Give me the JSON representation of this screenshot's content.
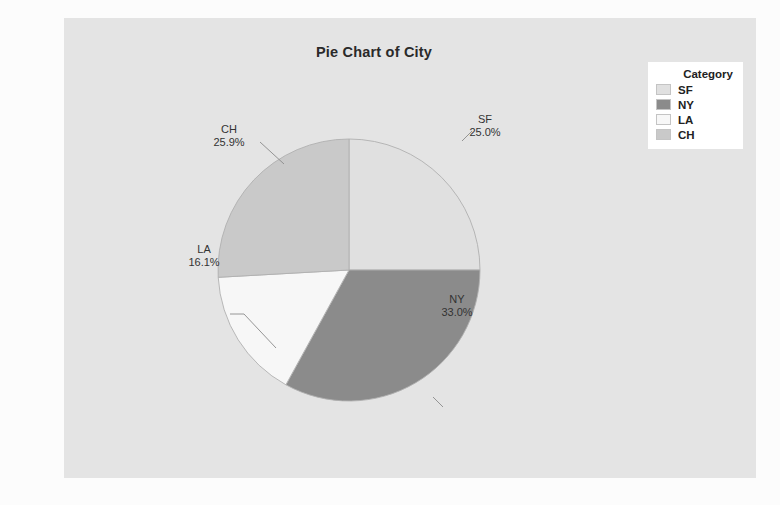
{
  "chart_data": {
    "type": "pie",
    "title": "Pie Chart of City",
    "categories": [
      "SF",
      "NY",
      "LA",
      "CH"
    ],
    "values": [
      25.0,
      33.0,
      16.1,
      25.9
    ],
    "labels": [
      "25.0%",
      "33.0%",
      "16.1%",
      "25.9%"
    ],
    "unit": "%",
    "start_angle_deg": 0,
    "direction": "clockwise",
    "legend_position": "top-right",
    "grid": false,
    "xlabel": "",
    "ylabel": "",
    "slices": [
      {
        "name": "SF",
        "value": 25.0,
        "label": "25.0%",
        "color": "#e0e0e0",
        "start_deg": 0.0,
        "end_deg": 90.0
      },
      {
        "name": "NY",
        "value": 33.0,
        "label": "33.0%",
        "color": "#8b8b8b",
        "start_deg": 90.0,
        "end_deg": 208.8
      },
      {
        "name": "LA",
        "value": 16.1,
        "label": "16.1%",
        "color": "#f7f7f7",
        "start_deg": 208.8,
        "end_deg": 266.8
      },
      {
        "name": "CH",
        "value": 25.9,
        "label": "25.9%",
        "color": "#c9c9c9",
        "start_deg": 266.8,
        "end_deg": 360.0
      }
    ]
  },
  "chart": {
    "title": "Pie Chart of City",
    "background_color": "#e4e4e4",
    "slice_colors": {
      "SF": "#e0e0e0",
      "NY": "#8b8b8b",
      "LA": "#f7f7f7",
      "CH": "#c9c9c9"
    },
    "slice_edge_color": "#b0b0b0",
    "labels": {
      "sf": {
        "name": "SF",
        "percent": "25.0%"
      },
      "ny": {
        "name": "NY",
        "percent": "33.0%"
      },
      "la": {
        "name": "LA",
        "percent": "16.1%"
      },
      "ch": {
        "name": "CH",
        "percent": "25.9%"
      }
    }
  },
  "legend": {
    "title": "Category",
    "background_color": "#ffffff",
    "items": [
      {
        "label": "SF",
        "color": "#e0e0e0"
      },
      {
        "label": "NY",
        "color": "#8b8b8b"
      },
      {
        "label": "LA",
        "color": "#f7f7f7"
      },
      {
        "label": "CH",
        "color": "#c9c9c9"
      }
    ]
  }
}
